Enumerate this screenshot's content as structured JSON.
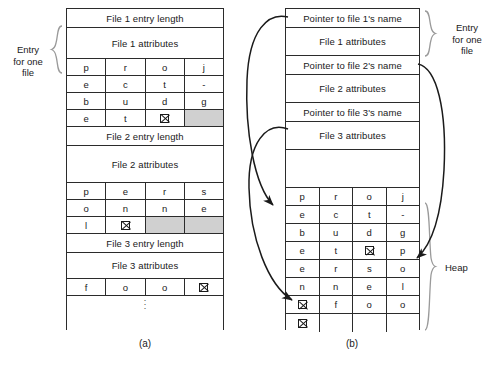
{
  "figure": {
    "caption_a": "(a)",
    "caption_b": "(b)"
  },
  "labels": {
    "entry_for_one_file_left": "Entry\nfor one\nfile",
    "entry_for_one_file_left_l1": "Entry",
    "entry_for_one_file_left_l2": "for one",
    "entry_for_one_file_left_l3": "file",
    "entry_for_one_file_right_l1": "Entry",
    "entry_for_one_file_right_l2": "for one",
    "entry_for_one_file_right_l3": "file",
    "heap": "Heap"
  },
  "inline_layout": {
    "title": "In-line file name storage",
    "entries": [
      {
        "length_row": "File 1 entry length",
        "attributes_row": "File 1 attributes",
        "name": "project-budget",
        "name_rows": [
          [
            "p",
            "r",
            "o",
            "j"
          ],
          [
            "e",
            "c",
            "t",
            "-"
          ],
          [
            "b",
            "u",
            "d",
            "g"
          ],
          [
            "e",
            "t",
            "NUL",
            "PAD"
          ]
        ]
      },
      {
        "length_row": "File 2 entry length",
        "attributes_row": "File 2 attributes",
        "name": "personnel",
        "name_rows": [
          [
            "p",
            "e",
            "r",
            "s"
          ],
          [
            "o",
            "n",
            "n",
            "e"
          ],
          [
            "l",
            "NUL",
            "PAD",
            "PAD"
          ]
        ]
      },
      {
        "length_row": "File 3 entry length",
        "attributes_row": "File 3 attributes",
        "name": "foo",
        "name_rows": [
          [
            "f",
            "o",
            "o",
            "NUL"
          ]
        ]
      }
    ],
    "continuation": "vertical-ellipsis"
  },
  "heap_layout": {
    "title": "Heap file name storage",
    "entries": [
      {
        "pointer_row": "Pointer to file 1's name",
        "attributes_row": "File 1 attributes"
      },
      {
        "pointer_row": "Pointer to file 2's name",
        "attributes_row": "File 2 attributes"
      },
      {
        "pointer_row": "Pointer to file 3's name",
        "attributes_row": "File 3 attributes"
      }
    ],
    "gap_row": "",
    "heap_rows": [
      [
        "p",
        "r",
        "o",
        "j"
      ],
      [
        "e",
        "c",
        "t",
        "-"
      ],
      [
        "b",
        "u",
        "d",
        "g"
      ],
      [
        "e",
        "t",
        "NUL",
        "p"
      ],
      [
        "e",
        "r",
        "s",
        "o"
      ],
      [
        "n",
        "n",
        "e",
        "l"
      ],
      [
        "NUL",
        "f",
        "o",
        "o"
      ],
      [
        "NUL",
        "",
        "",
        ""
      ]
    ],
    "pointers": [
      {
        "from": "Pointer to file 1's name",
        "to_heap_row": 0,
        "target_name": "project-budget"
      },
      {
        "from": "Pointer to file 2's name",
        "to_heap_row": 3,
        "target_name": "personnel"
      },
      {
        "from": "Pointer to file 3's name",
        "to_heap_row": 6,
        "target_name": "foo"
      }
    ]
  },
  "colors": {
    "line": "#2b2b2b",
    "padding_cell": "#d0d0d0",
    "background": "#ffffff",
    "brace": "#9a9a9a",
    "text": "#1a1a1a"
  }
}
